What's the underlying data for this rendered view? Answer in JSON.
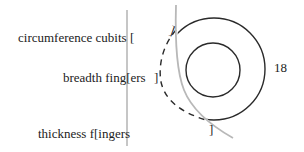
{
  "labels": {
    "circumference": "circumference cubits [",
    "breadth": "breadth fing[ers",
    "breadth_close": "]",
    "thickness": "thickness f[ingers",
    "dimension": "18"
  },
  "brackets": {
    "top_right": "]",
    "bottom_right": "]"
  },
  "colors": {
    "ink": "#222222",
    "gray_line": "#b8b8b8",
    "background": "#ffffff"
  }
}
